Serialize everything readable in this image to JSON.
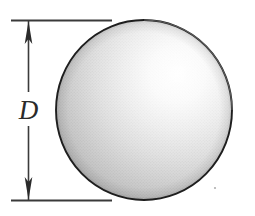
{
  "figure": {
    "name": "sphere-diameter-diagram",
    "background_color": "#ffffff"
  },
  "dimension": {
    "label": "D",
    "label_color": "#2a2a2a",
    "line_color": "#3b3b3b",
    "arrow_direction_top": "up",
    "arrow_direction_bottom": "down",
    "extension_line_color": "#3a3a3a"
  },
  "sphere": {
    "outline_color": "#1e1e1e",
    "highlight_color": "#ffffff",
    "midtone_color": "#dcdcdc",
    "shadow_color": "#a9a9a9",
    "edge_color": "#9a9a9a",
    "center_x": 144,
    "center_y": 110,
    "radius_x": 88,
    "radius_y": 90,
    "highlight_x": 176,
    "highlight_y": 72
  },
  "speck": {
    "color": "#b0b0b0",
    "x": 215,
    "y": 188
  }
}
